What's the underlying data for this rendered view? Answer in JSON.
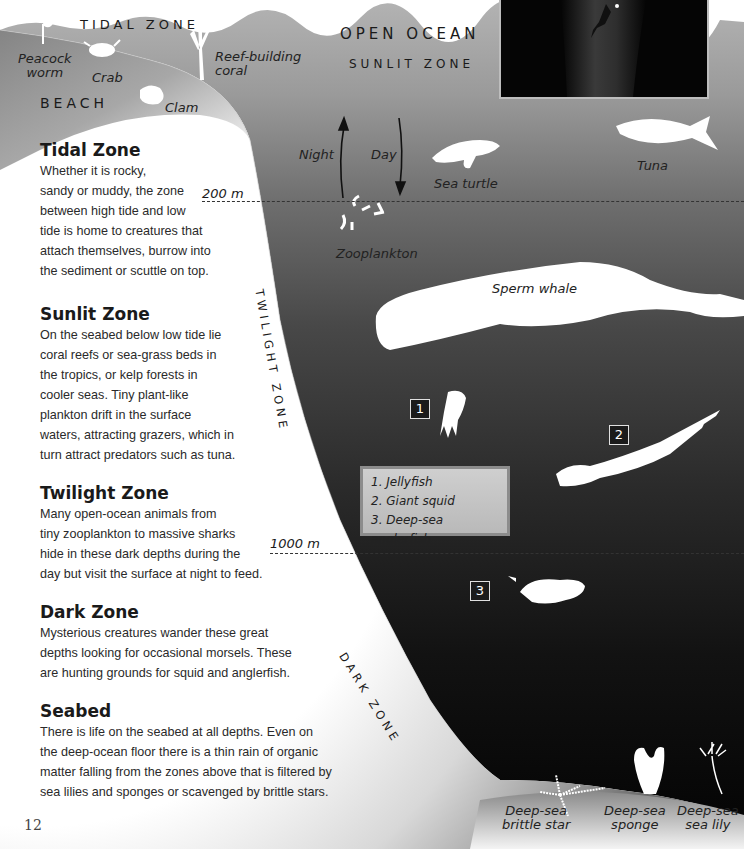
{
  "page": {
    "page_number": "12",
    "colors": {
      "surface_water": "#a8a8a8",
      "sunlit_water": "#8e8e8e",
      "twilight_water": "#4a4a4a",
      "dark_water": "#1c1c1c",
      "abyss_water": "#080808",
      "beach_shadow": "#5a5a5a",
      "text": "#1a1a1a",
      "key_box": "#c4c4c4"
    }
  },
  "headings": {
    "tidal_zone": "TIDAL ZONE",
    "beach": "BEACH",
    "open_ocean": "OPEN OCEAN",
    "sunlit_zone": "SUNLIT ZONE",
    "twilight_zone": "TWILIGHT ZONE",
    "dark_zone": "DARK ZONE"
  },
  "depth_markers": [
    {
      "label": "200 m"
    },
    {
      "label": "1000 m"
    }
  ],
  "migration": {
    "night_label": "Night",
    "day_label": "Day"
  },
  "creature_labels": {
    "peacock_worm": "Peacock worm",
    "peacock_worm_l1": "Peacock",
    "peacock_worm_l2": "worm",
    "crab": "Crab",
    "reef_coral_l1": "Reef-building",
    "reef_coral_l2": "coral",
    "clam": "Clam",
    "sea_turtle": "Sea turtle",
    "tuna": "Tuna",
    "zooplankton": "Zooplankton",
    "sperm_whale": "Sperm whale",
    "brittle_star_l1": "Deep-sea",
    "brittle_star_l2": "brittle star",
    "sponge_l1": "Deep-sea",
    "sponge_l2": "sponge",
    "sea_lily_l1": "Deep-sea",
    "sea_lily_l2": "sea lily"
  },
  "numbered_markers": [
    "1",
    "2",
    "3"
  ],
  "key": {
    "items": [
      "1. Jellyfish",
      "2. Giant squid",
      "3. Deep-sea anglerfish"
    ]
  },
  "sections": [
    {
      "title": "Tidal Zone",
      "lines": [
        "Whether it is rocky,",
        "sandy or muddy, the zone",
        "between high tide and low",
        "tide is home to creatures that",
        "attach themselves, burrow into",
        "the sediment or scuttle on top."
      ]
    },
    {
      "title": "Sunlit Zone",
      "lines": [
        "On the seabed below low tide lie",
        "coral reefs or sea-grass beds in",
        "the tropics, or kelp forests in",
        "cooler seas. Tiny plant-like",
        "plankton drift in the surface",
        "waters, attracting grazers, which in",
        "turn attract predators such as tuna."
      ]
    },
    {
      "title": "Twilight Zone",
      "lines": [
        "Many open-ocean animals from",
        "tiny zooplankton to massive sharks",
        "hide in these dark depths during the",
        "day but visit the surface at night to feed."
      ]
    },
    {
      "title": "Dark Zone",
      "lines": [
        "Mysterious creatures wander these great",
        "depths looking for occasional morsels. These",
        "are hunting grounds for squid and anglerfish."
      ]
    },
    {
      "title": "Seabed",
      "lines": [
        "There is life on the seabed at all depths. Even on",
        "the deep-ocean floor there is a thin rain of organic",
        "matter falling from the zones above that is filtered by",
        "sea lilies and sponges or scavenged by brittle stars."
      ]
    }
  ]
}
